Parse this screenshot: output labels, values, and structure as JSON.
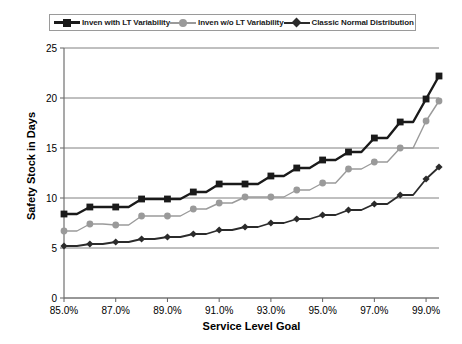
{
  "chart_data": {
    "type": "line",
    "title": "",
    "xlabel": "Service Level Goal",
    "ylabel": "Safety Stock in Days",
    "grid": true,
    "legend_position": "top",
    "xlim": [
      85.0,
      99.5
    ],
    "ylim": [
      0,
      25
    ],
    "ytick_labels": [
      "25",
      "20",
      "15",
      "10",
      "5",
      "0"
    ],
    "yticks": [
      25,
      20,
      15,
      10,
      5,
      0
    ],
    "xtick_labels": [
      "85.0%",
      "87.0%",
      "89.0%",
      "91.0%",
      "93.0%",
      "95.0%",
      "97.0%",
      "99.0%"
    ],
    "xticks": [
      85.0,
      87.0,
      89.0,
      91.0,
      93.0,
      95.0,
      97.0,
      99.0
    ],
    "x": [
      85.0,
      85.5,
      86.0,
      86.5,
      87.0,
      87.5,
      88.0,
      88.5,
      89.0,
      89.5,
      90.0,
      90.5,
      91.0,
      91.5,
      92.0,
      92.5,
      93.0,
      93.5,
      94.0,
      94.5,
      95.0,
      95.5,
      96.0,
      96.5,
      97.0,
      97.5,
      98.0,
      98.5,
      99.0,
      99.5
    ],
    "series": [
      {
        "name": "Inven with LT Variability",
        "marker": "square",
        "color": "#1a1a1a",
        "values": [
          8.4,
          8.4,
          9.1,
          9.1,
          9.1,
          9.1,
          9.9,
          9.9,
          9.9,
          9.9,
          10.6,
          10.6,
          11.4,
          11.4,
          11.4,
          11.4,
          12.2,
          12.2,
          13.0,
          13.0,
          13.8,
          13.8,
          14.6,
          14.6,
          16.0,
          16.0,
          17.6,
          17.6,
          19.9,
          22.2
        ]
      },
      {
        "name": "Inven w/o LT Variability",
        "marker": "circle",
        "color": "#9a9a9a",
        "values": [
          6.7,
          6.7,
          7.4,
          7.4,
          7.3,
          7.3,
          8.2,
          8.2,
          8.2,
          8.2,
          8.9,
          8.9,
          9.5,
          9.5,
          10.1,
          10.1,
          10.1,
          10.1,
          10.8,
          10.8,
          11.5,
          11.5,
          12.9,
          12.9,
          13.6,
          13.6,
          15.0,
          15.0,
          17.7,
          19.7
        ]
      },
      {
        "name": "Classic Normal Distribution",
        "marker": "diamond",
        "color": "#2b2b2b",
        "values": [
          5.2,
          5.2,
          5.4,
          5.4,
          5.6,
          5.6,
          5.9,
          5.9,
          6.1,
          6.1,
          6.4,
          6.4,
          6.8,
          6.8,
          7.1,
          7.1,
          7.5,
          7.5,
          7.9,
          7.9,
          8.3,
          8.3,
          8.8,
          8.8,
          9.4,
          9.4,
          10.3,
          10.3,
          11.9,
          13.1
        ]
      }
    ]
  },
  "legend": {
    "items": [
      {
        "label": "Inven with LT Variability"
      },
      {
        "label": "Inven w/o LT Variability"
      },
      {
        "label": "Classic Normal Distribution"
      }
    ]
  }
}
